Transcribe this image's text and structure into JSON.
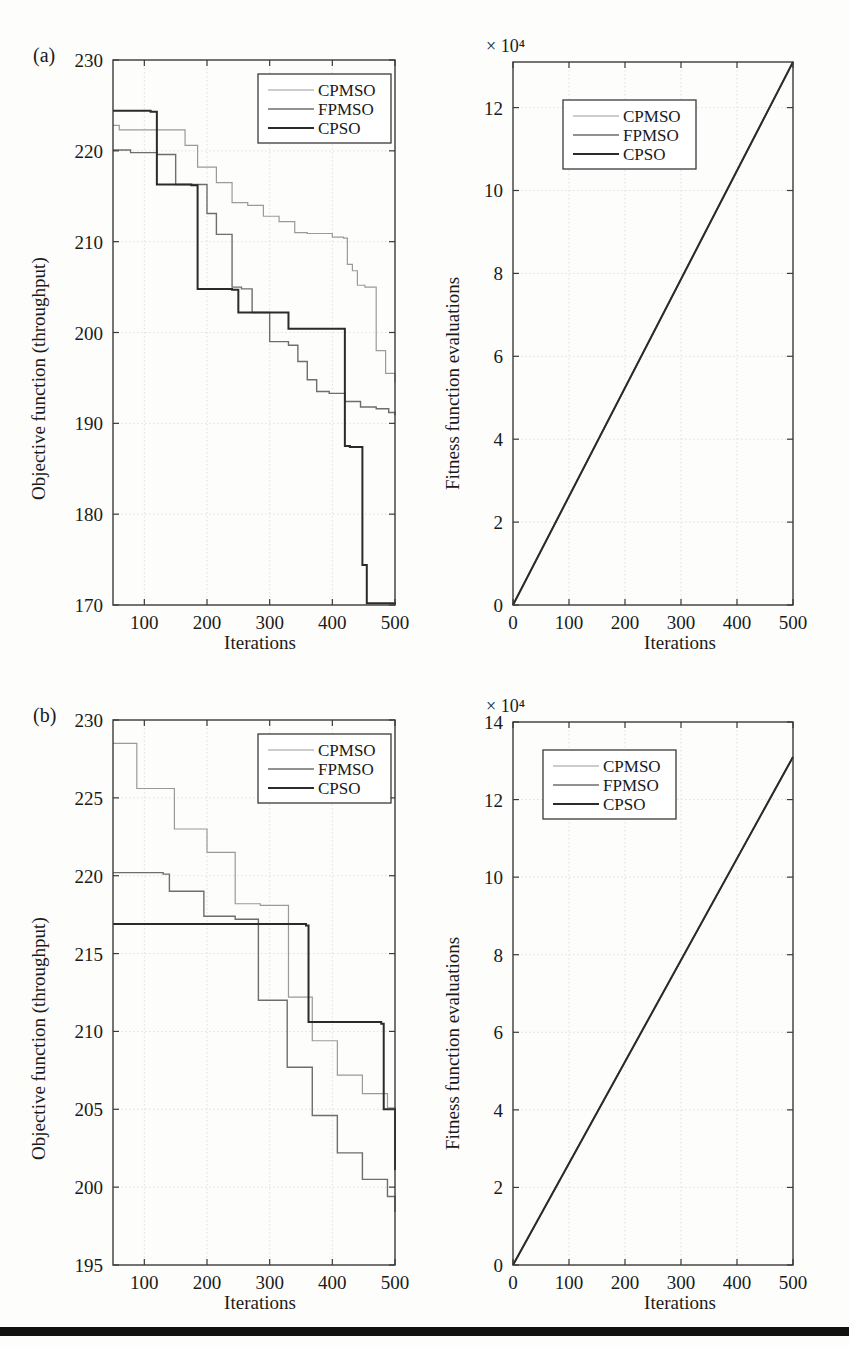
{
  "figure": {
    "panels": [
      {
        "tag": "(a)",
        "left_plot": {
          "xlabel": "Iterations",
          "ylabel": "Objective function (throughput)",
          "xticks": [
            100,
            200,
            300,
            400,
            500
          ],
          "yticks": [
            170,
            180,
            190,
            200,
            210,
            220,
            230
          ],
          "xlim": [
            50,
            500
          ],
          "ylim": [
            170,
            230
          ],
          "legend": [
            "CPMSO",
            "FPMSO",
            "CPSO"
          ]
        },
        "right_plot": {
          "xlabel": "Iterations",
          "ylabel": "Fitness function evaluations",
          "exponent": "× 10⁴",
          "xticks": [
            0,
            100,
            200,
            300,
            400,
            500
          ],
          "yticks": [
            0,
            2,
            4,
            6,
            8,
            10,
            12
          ],
          "xlim": [
            0,
            500
          ],
          "ylim": [
            0,
            13.1
          ],
          "legend": [
            "CPMSO",
            "FPMSO",
            "CPSO"
          ]
        }
      },
      {
        "tag": "(b)",
        "left_plot": {
          "xlabel": "Iterations",
          "ylabel": "Objective function (throughput)",
          "xticks": [
            100,
            200,
            300,
            400,
            500
          ],
          "yticks": [
            195,
            200,
            205,
            210,
            215,
            220,
            225,
            230
          ],
          "xlim": [
            50,
            500
          ],
          "ylim": [
            195,
            230
          ],
          "legend": [
            "CPMSO",
            "FPMSO",
            "CPSO"
          ]
        },
        "right_plot": {
          "xlabel": "Iterations",
          "ylabel": "Fitness function evaluations",
          "exponent": "× 10⁴",
          "xticks": [
            0,
            100,
            200,
            300,
            400,
            500
          ],
          "yticks": [
            0,
            2,
            4,
            6,
            8,
            10,
            12,
            14
          ],
          "xlim": [
            0,
            500
          ],
          "ylim": [
            0,
            14
          ],
          "legend": [
            "CPMSO",
            "FPMSO",
            "CPSO"
          ]
        }
      }
    ]
  },
  "chart_data": [
    {
      "id": "panel-a-objective",
      "type": "line",
      "title": "",
      "xlabel": "Iterations",
      "ylabel": "Objective function (throughput)",
      "xlim": [
        50,
        500
      ],
      "ylim": [
        170,
        230
      ],
      "xticks": [
        100,
        200,
        300,
        400,
        500
      ],
      "yticks": [
        170,
        180,
        190,
        200,
        210,
        220,
        230
      ],
      "grid": true,
      "legend_position": "top-right",
      "step": "post",
      "series": [
        {
          "name": "CPMSO",
          "x": [
            50,
            60,
            75,
            165,
            185,
            215,
            240,
            265,
            290,
            315,
            340,
            360,
            380,
            400,
            418,
            424,
            432,
            440,
            452,
            470,
            485,
            500
          ],
          "y": [
            222.8,
            222.3,
            222.3,
            220.6,
            218.2,
            216.5,
            214.3,
            214.0,
            212.8,
            212.2,
            211.0,
            210.9,
            210.9,
            210.5,
            210.4,
            207.5,
            206.8,
            205.2,
            205.0,
            198.0,
            195.5,
            194.5
          ]
        },
        {
          "name": "FPMSO",
          "x": [
            50,
            62,
            78,
            120,
            150,
            175,
            200,
            215,
            240,
            255,
            272,
            300,
            330,
            345,
            360,
            375,
            395,
            420,
            445,
            470,
            490,
            500
          ],
          "y": [
            220.1,
            220.1,
            219.8,
            219.6,
            216.3,
            216.3,
            213.1,
            210.8,
            205.0,
            204.8,
            202.2,
            199.0,
            198.6,
            196.8,
            194.8,
            193.5,
            193.3,
            192.4,
            191.8,
            191.6,
            191.2,
            190.9
          ]
        },
        {
          "name": "CPSO",
          "x": [
            50,
            75,
            110,
            120,
            175,
            185,
            240,
            250,
            280,
            330,
            340,
            420,
            428,
            448,
            455,
            500
          ],
          "y": [
            224.4,
            224.4,
            224.3,
            216.3,
            216.2,
            204.8,
            204.7,
            202.2,
            202.2,
            200.4,
            200.4,
            187.5,
            187.4,
            174.4,
            170.2,
            170.0
          ]
        }
      ]
    },
    {
      "id": "panel-a-evaluations",
      "type": "line",
      "title": "",
      "xlabel": "Iterations",
      "ylabel": "Fitness function evaluations",
      "exponent": "× 10⁴",
      "xlim": [
        0,
        500
      ],
      "ylim": [
        0,
        13.1
      ],
      "xticks": [
        0,
        100,
        200,
        300,
        400,
        500
      ],
      "yticks": [
        0,
        2,
        4,
        6,
        8,
        10,
        12
      ],
      "grid": true,
      "legend_position": "top-center",
      "series": [
        {
          "name": "CPMSO",
          "x": [
            0,
            500
          ],
          "y": [
            0,
            13.1
          ]
        },
        {
          "name": "FPMSO",
          "x": [
            0,
            500
          ],
          "y": [
            0,
            13.1
          ]
        },
        {
          "name": "CPSO",
          "x": [
            0,
            500
          ],
          "y": [
            0,
            13.1
          ]
        }
      ]
    },
    {
      "id": "panel-b-objective",
      "type": "line",
      "title": "",
      "xlabel": "Iterations",
      "ylabel": "Objective function (throughput)",
      "xlim": [
        50,
        500
      ],
      "ylim": [
        195,
        230
      ],
      "xticks": [
        100,
        200,
        300,
        400,
        500
      ],
      "yticks": [
        195,
        200,
        205,
        210,
        215,
        220,
        225,
        230
      ],
      "grid": true,
      "legend_position": "top-right",
      "step": "post",
      "series": [
        {
          "name": "CPMSO",
          "x": [
            50,
            78,
            88,
            135,
            148,
            188,
            200,
            235,
            245,
            275,
            285,
            318,
            330,
            358,
            368,
            398,
            408,
            438,
            448,
            478,
            488,
            500
          ],
          "y": [
            228.5,
            228.5,
            225.6,
            225.6,
            223.0,
            223.0,
            221.5,
            221.5,
            218.2,
            218.2,
            218.1,
            218.1,
            212.2,
            212.2,
            209.4,
            209.4,
            207.2,
            207.2,
            206.0,
            206.0,
            205.1,
            205.0
          ]
        },
        {
          "name": "FPMSO",
          "x": [
            50,
            60,
            130,
            140,
            185,
            195,
            235,
            245,
            272,
            282,
            318,
            328,
            358,
            368,
            398,
            408,
            438,
            448,
            478,
            488,
            500
          ],
          "y": [
            220.2,
            220.2,
            220.1,
            219.0,
            219.0,
            217.4,
            217.4,
            217.2,
            217.2,
            212.0,
            212.0,
            207.7,
            207.7,
            204.6,
            204.6,
            202.2,
            202.2,
            200.5,
            200.5,
            199.4,
            198.4
          ]
        },
        {
          "name": "CPSO",
          "x": [
            50,
            100,
            200,
            300,
            350,
            358,
            362,
            420,
            470,
            478,
            482,
            490,
            500
          ],
          "y": [
            216.9,
            216.9,
            216.9,
            216.9,
            216.9,
            216.8,
            210.6,
            210.6,
            210.6,
            210.5,
            205.0,
            205.0,
            201.1
          ]
        }
      ]
    },
    {
      "id": "panel-b-evaluations",
      "type": "line",
      "title": "",
      "xlabel": "Iterations",
      "ylabel": "Fitness function evaluations",
      "exponent": "× 10⁴",
      "xlim": [
        0,
        500
      ],
      "ylim": [
        0,
        14
      ],
      "xticks": [
        0,
        100,
        200,
        300,
        400,
        500
      ],
      "yticks": [
        0,
        2,
        4,
        6,
        8,
        10,
        12,
        14
      ],
      "grid": true,
      "legend_position": "top-center",
      "series": [
        {
          "name": "CPMSO",
          "x": [
            0,
            500
          ],
          "y": [
            0,
            13.1
          ]
        },
        {
          "name": "FPMSO",
          "x": [
            0,
            500
          ],
          "y": [
            0,
            13.1
          ]
        },
        {
          "name": "CPSO",
          "x": [
            0,
            500
          ],
          "y": [
            0,
            13.1
          ]
        }
      ]
    }
  ],
  "style": {
    "cpmso_color": "#9a9a9a",
    "fpmso_color": "#6e6e6e",
    "cpso_color": "#2b2b2b",
    "axis_color": "#3a3a3a",
    "grid_color": "#d8d8d8",
    "background": "#fdfdfb"
  }
}
